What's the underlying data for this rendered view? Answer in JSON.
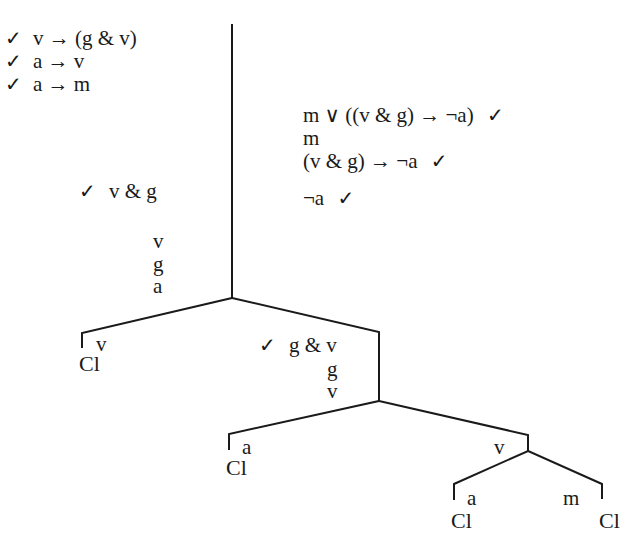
{
  "diagram": {
    "type": "truth-tree",
    "premises": [
      {
        "check": "✓",
        "formula": "v → (g & v)"
      },
      {
        "check": "✓",
        "formula": "a → v"
      },
      {
        "check": "✓",
        "formula": "a → m"
      }
    ],
    "trunk": [
      {
        "formula": "m ∨ ((v & g) → ¬a)",
        "check": "✓"
      },
      {
        "formula": "m",
        "check": ""
      },
      {
        "formula": "(v & g) → ¬a",
        "check": "✓"
      },
      {
        "formula": "¬a",
        "check": "✓"
      }
    ],
    "left_trunk": [
      {
        "check": "✓",
        "formula": "v & g"
      },
      {
        "formula": "v"
      },
      {
        "formula": "g"
      },
      {
        "formula": "a"
      }
    ],
    "branch1": {
      "left": {
        "formula": "v",
        "closed": "Cl"
      },
      "right": {
        "check": "✓",
        "formulas": [
          "g & v",
          "g",
          "v"
        ]
      }
    },
    "branch2": {
      "left": {
        "formula": "a",
        "closed": "Cl"
      },
      "right": {
        "formula": "v"
      }
    },
    "branch3": {
      "left": {
        "formula": "a",
        "closed": "Cl"
      },
      "right": {
        "formula": "m",
        "closed": "Cl"
      }
    },
    "line_color": "#1a1a1a"
  }
}
